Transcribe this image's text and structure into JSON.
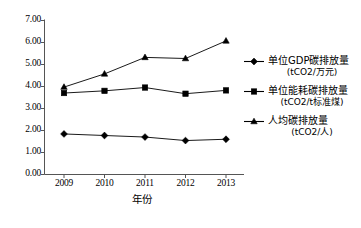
{
  "chart_data": {
    "type": "line",
    "title": "",
    "xlabel": "年份",
    "ylabel": "",
    "x": [
      "2009",
      "2010",
      "2011",
      "2012",
      "2013"
    ],
    "categories": [
      "2009",
      "2010",
      "2011",
      "2012",
      "2013"
    ],
    "ylim": [
      0.0,
      7.0
    ],
    "ytick_step": 1.0,
    "yticks": [
      "7.00",
      "6.00",
      "5.00",
      "4.00",
      "3.00",
      "2.00",
      "1.00",
      "0.00"
    ],
    "ytick_values": [
      7.0,
      6.0,
      5.0,
      4.0,
      3.0,
      2.0,
      1.0,
      0.0
    ],
    "grid": false,
    "legend_position": "right",
    "series": [
      {
        "name": "单位GDP碳排放量",
        "unit": "(tCO2/万元)",
        "marker": "diamond",
        "color": "#000000",
        "values": [
          1.82,
          1.75,
          1.68,
          1.52,
          1.58
        ]
      },
      {
        "name": "单位能耗碳排放量",
        "unit": "(tCO2/t标准煤)",
        "marker": "square",
        "color": "#000000",
        "values": [
          3.68,
          3.78,
          3.93,
          3.65,
          3.8
        ]
      },
      {
        "name": "人均碳排放量",
        "unit": "(tCO2/人)",
        "marker": "triangle",
        "color": "#000000",
        "values": [
          3.95,
          4.55,
          5.3,
          5.25,
          6.05
        ]
      }
    ]
  },
  "axis": {
    "x_title": "年份"
  },
  "legend": {
    "items": [
      {
        "label": "单位GDP碳排放量",
        "unit": "(tCO2/万元)",
        "marker": "diamond"
      },
      {
        "label": "单位能耗碳排放量",
        "unit": "(tCO2/t标准煤)",
        "marker": "square"
      },
      {
        "label": "人均碳排放量",
        "unit": "(tCO2/人)",
        "marker": "triangle"
      }
    ]
  }
}
